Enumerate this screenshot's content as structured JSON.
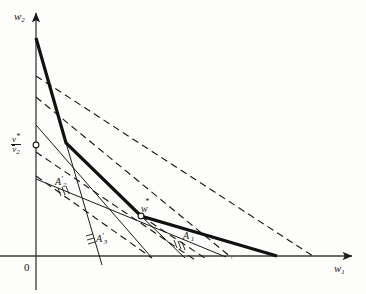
{
  "figure": {
    "type": "math-diagram",
    "background": "#fdfdfb",
    "ink_color": "#1a1a1a"
  },
  "axes": {
    "x_label": "w",
    "x_label_sub": "1",
    "y_label": "w",
    "y_label_sub": "2",
    "origin_label": "0",
    "origin_px": [
      36,
      256
    ],
    "x_axis_end_px": [
      352,
      256
    ],
    "y_axis_end_px": [
      36,
      13
    ]
  },
  "points": [
    {
      "name": "optimal-point",
      "label_main": "w",
      "label_sup": "*",
      "px": [
        141,
        216
      ],
      "marker": "open-circle"
    },
    {
      "name": "y-intercept-value",
      "label_num": "v",
      "label_num_sup": "*",
      "label_den": "v",
      "label_den_sub": "2",
      "label_den_overline": true,
      "px": [
        36,
        145
      ],
      "marker": "open-circle"
    }
  ],
  "region_labels": [
    {
      "name": "A1-prime",
      "main": "A",
      "sup": "'",
      "sub": "1",
      "px": [
        185,
        236
      ]
    },
    {
      "name": "A2-prime",
      "main": "A",
      "sup": "'",
      "sub": "2",
      "px": [
        57,
        183
      ]
    },
    {
      "name": "A3-prime",
      "main": "A",
      "sup": "'",
      "sub": "3",
      "px": [
        98,
        240
      ]
    }
  ],
  "envelope": {
    "name": "thick-envelope-polyline",
    "stroke_width": 3.2,
    "points_px": [
      [
        36,
        38
      ],
      [
        66,
        143
      ],
      [
        141,
        216
      ],
      [
        277,
        256
      ]
    ]
  },
  "dashed_lines": [
    {
      "name": "dashed-line-1",
      "from_px": [
        36,
        76
      ],
      "to_px": [
        313,
        256
      ]
    },
    {
      "name": "dashed-line-2",
      "from_px": [
        36,
        97
      ],
      "to_px": [
        232,
        258
      ]
    },
    {
      "name": "dashed-line-3",
      "from_px": [
        36,
        152
      ],
      "to_px": [
        195,
        260
      ]
    },
    {
      "name": "dashed-line-4",
      "from_px": [
        36,
        176
      ],
      "to_px": [
        152,
        258
      ]
    },
    {
      "name": "dashed-line-5",
      "from_px": [
        141,
        216
      ],
      "to_px": [
        205,
        258
      ]
    }
  ],
  "solid_lines": [
    {
      "name": "solid-line-A2",
      "from_px": [
        36,
        125
      ],
      "to_px": [
        152,
        258
      ]
    },
    {
      "name": "solid-line-A3",
      "from_px": [
        66,
        143
      ],
      "to_px": [
        102,
        265
      ]
    },
    {
      "name": "solid-line-shallow",
      "from_px": [
        36,
        179
      ],
      "to_px": [
        226,
        257
      ]
    },
    {
      "name": "solid-line-w-right",
      "from_px": [
        141,
        216
      ],
      "to_px": [
        185,
        258
      ]
    }
  ],
  "hatchings": [
    {
      "name": "hatch-A2",
      "anchor_px": [
        62,
        192
      ],
      "count": 3
    },
    {
      "name": "hatch-A1",
      "anchor_px": [
        178,
        245
      ],
      "count": 3
    },
    {
      "name": "hatch-A3",
      "anchor_px": [
        90,
        243
      ],
      "count": 3
    }
  ]
}
